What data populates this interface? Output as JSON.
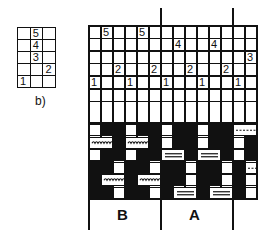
{
  "small_grid": {
    "label": "b)",
    "cols": 3,
    "rows": 5,
    "numbers": [
      {
        "row": 0,
        "col": 1,
        "text": "5"
      },
      {
        "row": 1,
        "col": 1,
        "text": "4"
      },
      {
        "row": 2,
        "col": 1,
        "text": "3"
      },
      {
        "row": 3,
        "col": 2,
        "text": "2"
      },
      {
        "row": 4,
        "col": 0,
        "text": "1"
      }
    ]
  },
  "main_grid": {
    "header_numbers": [
      {
        "row": 0,
        "col": 1,
        "text": "5"
      },
      {
        "row": 0,
        "col": 4,
        "text": "5"
      },
      {
        "row": 1,
        "col": 7,
        "text": "4"
      },
      {
        "row": 1,
        "col": 10,
        "text": "4"
      },
      {
        "row": 2,
        "col": 13,
        "text": "3"
      },
      {
        "row": 3,
        "col": 2,
        "text": "2"
      },
      {
        "row": 3,
        "col": 5,
        "text": "2"
      },
      {
        "row": 3,
        "col": 8,
        "text": "2"
      },
      {
        "row": 3,
        "col": 11,
        "text": "2"
      },
      {
        "row": 4,
        "col": 0,
        "text": "1"
      },
      {
        "row": 4,
        "col": 3,
        "text": "1"
      },
      {
        "row": 4,
        "col": 6,
        "text": "1"
      },
      {
        "row": 4,
        "col": 9,
        "text": "1"
      },
      {
        "row": 4,
        "col": 12,
        "text": "1"
      }
    ],
    "sections": [
      {
        "label": "B"
      },
      {
        "label": "A"
      }
    ],
    "pattern_legend": {
      "wavy": "B-section float marks",
      "double_line": "A-section float marks",
      "dashed": "next-section float marks"
    }
  }
}
